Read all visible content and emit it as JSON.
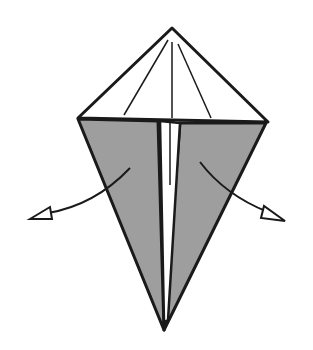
{
  "diagram": {
    "title": "",
    "colors": {
      "paper_front": "#ffffff",
      "paper_back": "#9e9e9e",
      "line": "#1a1a1a"
    },
    "elements": [
      {
        "name": "top-flap",
        "shape": "triangle",
        "fill": "white"
      },
      {
        "name": "crease-lines",
        "count": 3
      },
      {
        "name": "left-flap",
        "shape": "shaded narrow triangle"
      },
      {
        "name": "right-flap",
        "shape": "shaded narrow triangle"
      },
      {
        "name": "arrow-left",
        "direction": "open outward left"
      },
      {
        "name": "arrow-right",
        "direction": "open outward right"
      }
    ]
  }
}
